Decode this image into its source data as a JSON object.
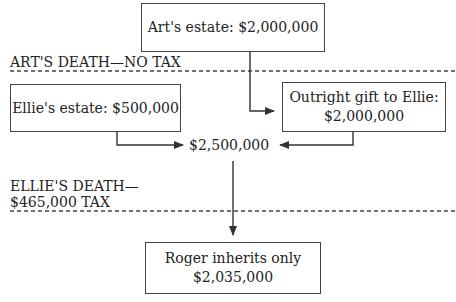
{
  "diagram": {
    "nodes": {
      "arts_estate": {
        "text": "Art's estate: $2,000,000"
      },
      "ellies_estate": {
        "text": "Ellie's estate: $500,000"
      },
      "gift": {
        "line1": "Outright gift to Ellie:",
        "line2": "$2,000,000"
      },
      "combined": {
        "text": "$2,500,000"
      },
      "roger": {
        "line1": "Roger inherits only",
        "line2": "$2,035,000"
      }
    },
    "events": {
      "arts_death": {
        "text": "ART'S DEATH—NO TAX"
      },
      "ellies_death": {
        "line1": "ELLIE'S DEATH—",
        "line2": "$465,000 TAX"
      }
    },
    "edges": [
      {
        "from": "arts_estate",
        "to": "gift"
      },
      {
        "from": "ellies_estate",
        "to": "combined"
      },
      {
        "from": "gift",
        "to": "combined"
      },
      {
        "from": "combined",
        "to": "roger"
      }
    ],
    "colors": {
      "line": "#333333",
      "text": "#222222",
      "background": "#ffffff"
    }
  }
}
